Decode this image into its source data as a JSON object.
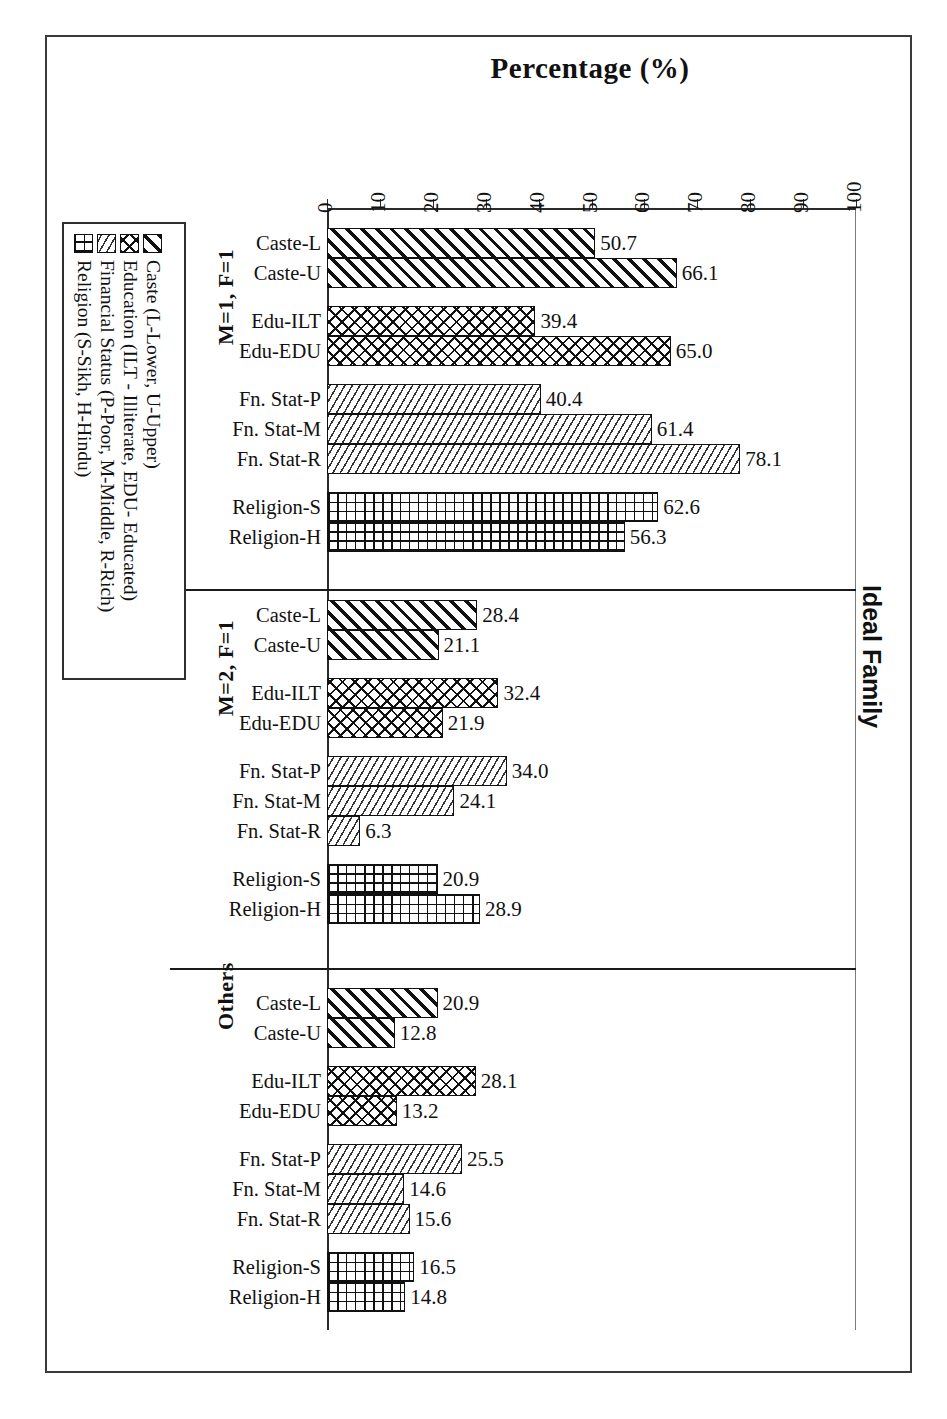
{
  "chart_data": {
    "type": "bar",
    "orientation": "horizontal",
    "title": "Percentage (%)",
    "outer_title": "Ideal Family",
    "xlabel": "Percentage (%)",
    "ylabel": "",
    "xlim": [
      0,
      100
    ],
    "grid": false,
    "legend_position": "left",
    "tick_labels": [
      "0",
      "10",
      "20",
      "30",
      "40",
      "50",
      "60",
      "70",
      "80",
      "90",
      "100"
    ],
    "tick_values": [
      0,
      10,
      20,
      30,
      40,
      50,
      60,
      70,
      80,
      90,
      100
    ],
    "categories": [
      "Caste-L",
      "Caste-U",
      "Edu-ILT",
      "Edu-EDU",
      "Fn. Stat-P",
      "Fn. Stat-M",
      "Fn. Stat-R",
      "Religion-S",
      "Religion-H"
    ],
    "panels": [
      {
        "label": "M=1, F=1",
        "bars": [
          {
            "category": "Caste-L",
            "value": 50.7,
            "series": "Caste"
          },
          {
            "category": "Caste-U",
            "value": 66.1,
            "series": "Caste"
          },
          {
            "category": "Edu-ILT",
            "value": 39.4,
            "series": "Education"
          },
          {
            "category": "Edu-EDU",
            "value": 65.0,
            "series": "Education"
          },
          {
            "category": "Fn. Stat-P",
            "value": 40.4,
            "series": "Financial Status"
          },
          {
            "category": "Fn. Stat-M",
            "value": 61.4,
            "series": "Financial Status"
          },
          {
            "category": "Fn. Stat-R",
            "value": 78.1,
            "series": "Financial Status"
          },
          {
            "category": "Religion-S",
            "value": 62.6,
            "series": "Religion"
          },
          {
            "category": "Religion-H",
            "value": 56.3,
            "series": "Religion"
          }
        ]
      },
      {
        "label": "M=2, F=1",
        "bars": [
          {
            "category": "Caste-L",
            "value": 28.4,
            "series": "Caste"
          },
          {
            "category": "Caste-U",
            "value": 21.1,
            "series": "Caste"
          },
          {
            "category": "Edu-ILT",
            "value": 32.4,
            "series": "Education"
          },
          {
            "category": "Edu-EDU",
            "value": 21.9,
            "series": "Education"
          },
          {
            "category": "Fn. Stat-P",
            "value": 34.0,
            "series": "Financial Status"
          },
          {
            "category": "Fn. Stat-M",
            "value": 24.1,
            "series": "Financial Status"
          },
          {
            "category": "Fn. Stat-R",
            "value": 6.3,
            "series": "Financial Status"
          },
          {
            "category": "Religion-S",
            "value": 20.9,
            "series": "Religion"
          },
          {
            "category": "Religion-H",
            "value": 28.9,
            "series": "Religion"
          }
        ]
      },
      {
        "label": "Others",
        "bars": [
          {
            "category": "Caste-L",
            "value": 20.9,
            "series": "Caste"
          },
          {
            "category": "Caste-U",
            "value": 12.8,
            "series": "Caste"
          },
          {
            "category": "Edu-ILT",
            "value": 28.1,
            "series": "Education"
          },
          {
            "category": "Edu-EDU",
            "value": 13.2,
            "series": "Education"
          },
          {
            "category": "Fn. Stat-P",
            "value": 25.5,
            "series": "Financial Status"
          },
          {
            "category": "Fn. Stat-M",
            "value": 14.6,
            "series": "Financial Status"
          },
          {
            "category": "Fn. Stat-R",
            "value": 15.6,
            "series": "Financial Status"
          },
          {
            "category": "Religion-S",
            "value": 16.5,
            "series": "Religion"
          },
          {
            "category": "Religion-H",
            "value": 14.8,
            "series": "Religion"
          }
        ]
      }
    ],
    "legend": [
      {
        "label": "Caste (L-Lower, U-Upper)",
        "pattern": "diagonal-hatch",
        "key": "caste"
      },
      {
        "label": "Education (ILT - Illiterate, EDU- Educated)",
        "pattern": "cross-hatch",
        "key": "edu"
      },
      {
        "label": "Financial Status (P-Poor, M-Middle, R-Rich)",
        "pattern": "fine-diagonal",
        "key": "fin"
      },
      {
        "label": "Religion (S-Sikh, H-Hindu)",
        "pattern": "grid",
        "key": "rel"
      }
    ]
  }
}
